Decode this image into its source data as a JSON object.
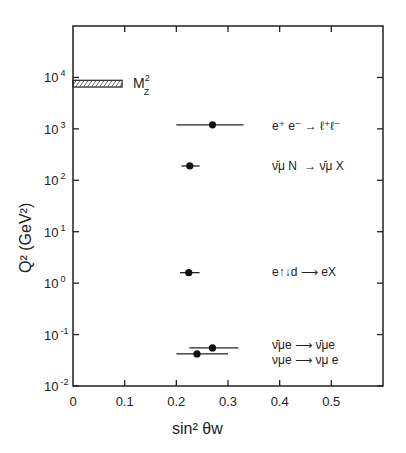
{
  "chart_data": {
    "type": "scatter",
    "title": "",
    "xlabel": "sin² θw",
    "ylabel": "Q² (GeV²)",
    "xlim": [
      0,
      0.6
    ],
    "ylim": [
      0.01,
      100000
    ],
    "yscale": "log",
    "grid": false,
    "x_ticks": [
      "0",
      "0.1",
      "0.2",
      "0.3",
      "0.4",
      "0.5"
    ],
    "y_ticks": [
      {
        "base": "10",
        "exp": "4"
      },
      {
        "base": "10",
        "exp": "3"
      },
      {
        "base": "10",
        "exp": "2"
      },
      {
        "base": "10",
        "exp": "1"
      },
      {
        "base": "10",
        "exp": "0"
      },
      {
        "base": "10",
        "exp": "-1"
      },
      {
        "base": "10",
        "exp": "-2"
      }
    ],
    "band": {
      "label": "M",
      "label_sup": "2",
      "label_sub": "Z",
      "x_range": [
        0,
        0.095
      ],
      "y_range": [
        6500,
        8800
      ]
    },
    "series": [
      {
        "name": "e⁺ e⁻ → ℓ⁺ℓ⁻",
        "x": 0.27,
        "x_err": [
          0.2,
          0.33
        ],
        "y": 1200
      },
      {
        "name": "ν̄μ N → ν̄μ X (νμ N → νμ X)",
        "x": 0.226,
        "x_err": [
          0.21,
          0.245
        ],
        "y": 190
      },
      {
        "name": "e↑↓d → eX",
        "x": 0.224,
        "x_err": [
          0.207,
          0.245
        ],
        "y": 1.6
      },
      {
        "name": "ν̄μ e → ν̄μ e",
        "x": 0.27,
        "x_err": [
          0.225,
          0.32
        ],
        "y": 0.055
      },
      {
        "name": "νμ e → νμ e",
        "x": 0.24,
        "x_err": [
          0.2,
          0.3
        ],
        "y": 0.042
      }
    ]
  },
  "labels": {
    "mz": "M",
    "mz_sup": "2",
    "mz_sub": "Z",
    "ee": "e⁺ e⁻ → ℓ⁺ℓ⁻",
    "nuN_a": "ν̆μ N",
    "nuN_b": "→ ν̆μ X",
    "ed": "e↑↓d ⟶ eX",
    "nubar_e": "ν̄μe ⟶ ν̄μe",
    "nu_e": "νμe ⟶ νμ e",
    "xlabel": "sin² θw",
    "ylabel": "Q² (GeV²)"
  }
}
